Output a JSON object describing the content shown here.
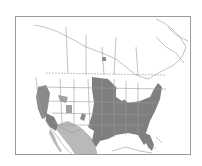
{
  "map": {
    "type": "range map",
    "region": "North America (Canada, United States, Mexico)",
    "legend": [
      {
        "label": "primary range",
        "color": "#7f7f7f"
      },
      {
        "label": "secondary range",
        "color": "#b9b9b9"
      }
    ],
    "colors": {
      "background": "#ffffff",
      "border_lines": "#9a9a9a",
      "dark_range": "#7f7f7f",
      "light_range": "#b9b9b9",
      "frame": "#9a9a9a"
    }
  }
}
